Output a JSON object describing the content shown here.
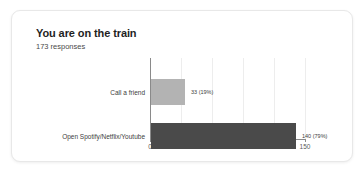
{
  "card": {
    "title": "You are on the train",
    "subtitle": "173 responses"
  },
  "chart_data": {
    "type": "bar",
    "orientation": "horizontal",
    "title": "You are on the train",
    "subtitle": "173 responses",
    "total_responses": 173,
    "categories": [
      "Call a friend",
      "Open Spotify/Netflix/Youtube"
    ],
    "values": [
      33,
      140
    ],
    "value_labels": [
      "33 (19%)",
      "140 (79%)"
    ],
    "bar_colors": [
      "#b3b3b3",
      "#4a4a4a"
    ],
    "xlabel": "",
    "ylabel": "",
    "xlim": [
      0,
      150
    ],
    "xticks": [
      0,
      30,
      60,
      90,
      120,
      150
    ],
    "xtick_labels": [
      "0",
      "30",
      "60",
      "90",
      "120",
      "150"
    ],
    "grid": true,
    "legend": false
  }
}
